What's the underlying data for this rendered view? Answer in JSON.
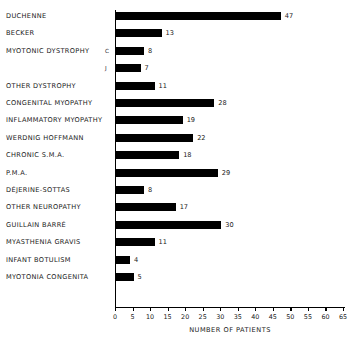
{
  "chart_data": {
    "type": "bar",
    "orientation": "horizontal",
    "title": "",
    "xlabel": "Number of Patients",
    "ylabel": "",
    "xlim": [
      0,
      65
    ],
    "xticks": [
      0,
      5,
      10,
      15,
      20,
      25,
      30,
      35,
      40,
      45,
      50,
      55,
      60,
      65
    ],
    "grid": false,
    "legend": null,
    "bar_color": "#000000",
    "categories": [
      "Duchenne",
      "Becker",
      "Myotonic Dystrophy",
      "Other Dystrophy",
      "Congenital Myopathy",
      "Inflammatory Myopathy",
      "Werdnig Hoffmann",
      "Chronic S.M.A.",
      "P.M.A.",
      "Déjerine-Sottas",
      "Other Neuropathy",
      "Guillain Barré",
      "Myasthenia Gravis",
      "Infant Botulism",
      "Myotonia Congenita"
    ],
    "bars": [
      {
        "category": "Duchenne",
        "value": 47,
        "label": "47",
        "sub": ""
      },
      {
        "category": "Becker",
        "value": 13,
        "label": "13",
        "sub": ""
      },
      {
        "category": "Myotonic Dystrophy",
        "value": 8,
        "label": "8",
        "sub": "C"
      },
      {
        "category": "Myotonic Dystrophy",
        "value": 7,
        "label": "7",
        "sub": "J"
      },
      {
        "category": "Other Dystrophy",
        "value": 11,
        "label": "11",
        "sub": ""
      },
      {
        "category": "Congenital Myopathy",
        "value": 28,
        "label": "28",
        "sub": ""
      },
      {
        "category": "Inflammatory Myopathy",
        "value": 19,
        "label": "19",
        "sub": ""
      },
      {
        "category": "Werdnig Hoffmann",
        "value": 22,
        "label": "22",
        "sub": ""
      },
      {
        "category": "Chronic S.M.A.",
        "value": 18,
        "label": "18",
        "sub": ""
      },
      {
        "category": "P.M.A.",
        "value": 29,
        "label": "29",
        "sub": ""
      },
      {
        "category": "Déjerine-Sottas",
        "value": 8,
        "label": "8",
        "sub": ""
      },
      {
        "category": "Other Neuropathy",
        "value": 17,
        "label": "17",
        "sub": ""
      },
      {
        "category": "Guillain Barré",
        "value": 30,
        "label": "30",
        "sub": ""
      },
      {
        "category": "Myasthenia Gravis",
        "value": 11,
        "label": "11",
        "sub": ""
      },
      {
        "category": "Infant Botulism",
        "value": 4,
        "label": "4",
        "sub": ""
      },
      {
        "category": "Myotonia Congenita",
        "value": 5,
        "label": "5",
        "sub": ""
      }
    ]
  }
}
